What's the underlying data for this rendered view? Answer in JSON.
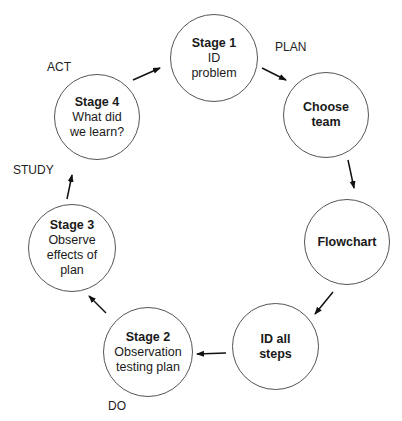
{
  "diagram": {
    "type": "cycle",
    "colors": {
      "stroke": "#555555",
      "text": "#1a1a1a",
      "background": "#ffffff"
    },
    "phases": {
      "plan": "PLAN",
      "act": "ACT",
      "study": "STUDY",
      "do": "DO"
    },
    "nodes": [
      {
        "id": "stage1",
        "title": "Stage 1",
        "lines": [
          "ID",
          "problem"
        ]
      },
      {
        "id": "choose-team",
        "title": "Choose team",
        "lines": []
      },
      {
        "id": "flowchart",
        "title": "Flowchart",
        "lines": []
      },
      {
        "id": "id-all-steps",
        "title": "ID all steps",
        "lines": []
      },
      {
        "id": "stage2",
        "title": "Stage 2",
        "lines": [
          "Observation",
          "testing plan"
        ]
      },
      {
        "id": "stage3",
        "title": "Stage 3",
        "lines": [
          "Observe",
          "effects of",
          "plan"
        ]
      },
      {
        "id": "stage4",
        "title": "Stage 4",
        "lines": [
          "What did",
          "we learn?"
        ]
      }
    ],
    "edges": [
      [
        "stage1",
        "choose-team"
      ],
      [
        "choose-team",
        "flowchart"
      ],
      [
        "flowchart",
        "id-all-steps"
      ],
      [
        "id-all-steps",
        "stage2"
      ],
      [
        "stage2",
        "stage3"
      ],
      [
        "stage3",
        "stage4"
      ],
      [
        "stage4",
        "stage1"
      ]
    ]
  },
  "labels": {
    "stage1_title": "Stage 1",
    "stage1_l1": "ID",
    "stage1_l2": "problem",
    "choose_l1": "Choose",
    "choose_l2": "team",
    "flowchart": "Flowchart",
    "idall_l1": "ID all",
    "idall_l2": "steps",
    "stage2_title": "Stage 2",
    "stage2_l1": "Observation",
    "stage2_l2": "testing plan",
    "stage3_title": "Stage 3",
    "stage3_l1": "Observe",
    "stage3_l2": "effects of",
    "stage3_l3": "plan",
    "stage4_title": "Stage 4",
    "stage4_l1": "What did",
    "stage4_l2": "we learn?"
  }
}
